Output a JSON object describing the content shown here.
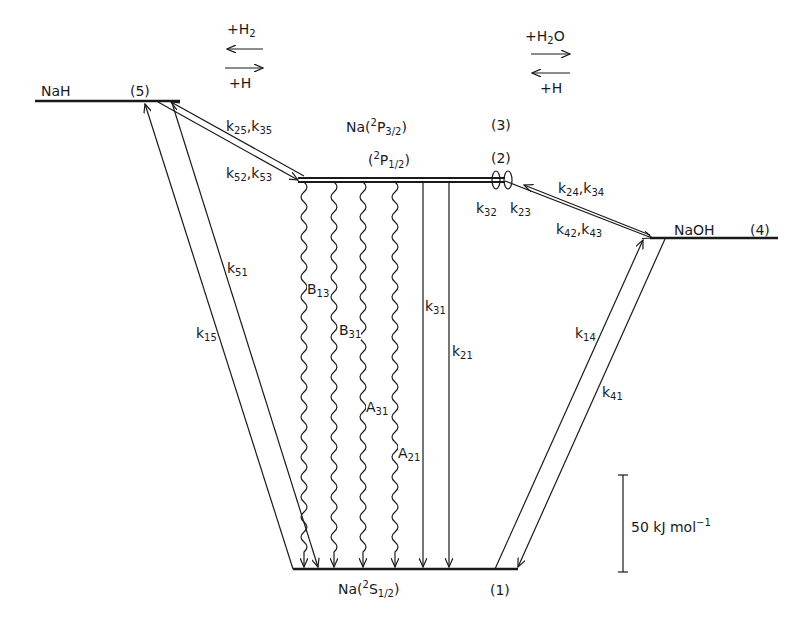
{
  "colors": {
    "ink": "#1a1a1a",
    "background": "#ffffff"
  },
  "levels": [
    {
      "id": 1,
      "label": "Na(²S₁/₂)",
      "species": "Na",
      "term": "2",
      "sym": "S",
      "j": "1/2",
      "num": "(1)"
    },
    {
      "id": 2,
      "label": "(²P₁/₂)",
      "term": "2",
      "sym": "P",
      "j": "1/2",
      "num": "(2)"
    },
    {
      "id": 3,
      "label": "Na(²P₃/₂)",
      "species": "Na",
      "term": "2",
      "sym": "P",
      "j": "3/2",
      "num": "(3)"
    },
    {
      "id": 4,
      "label": "NaOH",
      "num": "(4)"
    },
    {
      "id": 5,
      "label": "NaH",
      "num": "(5)"
    }
  ],
  "reactions": {
    "left": {
      "forward": "+H",
      "forward_sub": "2",
      "reverse": "+H"
    },
    "right": {
      "forward": "+H",
      "forward_sub": "2",
      "forward_tail": "O",
      "reverse": "+H"
    }
  },
  "rate_labels": {
    "k25_k35": [
      "25",
      "35"
    ],
    "k52_k53": [
      "52",
      "53"
    ],
    "k24_k34": [
      "24",
      "34"
    ],
    "k42_k43": [
      "42",
      "43"
    ],
    "k32": "32",
    "k23": "23",
    "k51": "51",
    "k15": "15",
    "k31": "31",
    "k21": "21",
    "k14": "14",
    "k41": "41"
  },
  "radiative_labels": {
    "B13": [
      "B",
      "13"
    ],
    "B31": [
      "B",
      "31"
    ],
    "A31": [
      "A",
      "31"
    ],
    "A21": [
      "A",
      "21"
    ]
  },
  "scale_bar": {
    "value": "50",
    "unit": "kJ mol",
    "exp": "−1"
  },
  "k_letter": "k",
  "species_na": "Na(",
  "paren_close": ")"
}
